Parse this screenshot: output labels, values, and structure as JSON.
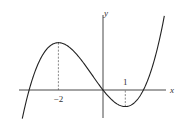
{
  "chart_data": {
    "type": "line",
    "title": "",
    "xlabel": "x",
    "ylabel": "y",
    "function": "f(x) = x^3/3 + x^2/2 - 2x",
    "xlim": [
      -3.7,
      3.0
    ],
    "ylim": [
      -1.9,
      4.8
    ],
    "x_ticks": [
      {
        "value": -2,
        "label": "−2"
      },
      {
        "value": 1,
        "label": "1"
      }
    ],
    "critical_points": [
      {
        "x": -2,
        "y": 3.333,
        "kind": "local-max"
      },
      {
        "x": 1,
        "y": -1.167,
        "kind": "local-min"
      }
    ],
    "roots": [
      -3.31,
      0,
      1.81
    ],
    "grid": false,
    "legend": "none"
  }
}
